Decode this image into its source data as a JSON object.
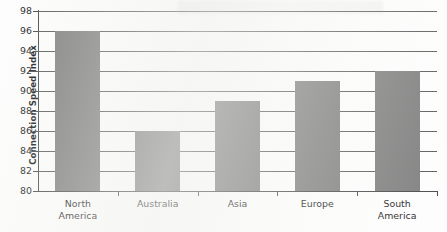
{
  "chart_data": {
    "type": "bar",
    "title": "",
    "subtitle": "",
    "xlabel": "",
    "ylabel": "Connection Speed Index",
    "categories": [
      "North America",
      "Australia",
      "Asia",
      "Europe",
      "South America"
    ],
    "category_lines": [
      [
        "North",
        "America"
      ],
      [
        "Australia"
      ],
      [
        "Asia"
      ],
      [
        "Europe"
      ],
      [
        "South",
        "America"
      ]
    ],
    "values": [
      96,
      86,
      89,
      91,
      92
    ],
    "ylim": [
      80,
      98
    ],
    "ytick_step": 2,
    "yticks": [
      98,
      96,
      94,
      92,
      90,
      88,
      86,
      84,
      82,
      80
    ],
    "ytick_labels": [
      "98",
      "96",
      "94",
      "92",
      "90",
      "88",
      "86",
      "84",
      "82",
      "80"
    ],
    "grid": true,
    "grid_axis": "y",
    "legend": false,
    "legend_position": "none",
    "bar_color": "#808080",
    "grid_color": "#5c5c5c",
    "axis_color": "#4a4a4a",
    "text_color": "#1d1d1d",
    "background_color": "#fdfdfd"
  }
}
